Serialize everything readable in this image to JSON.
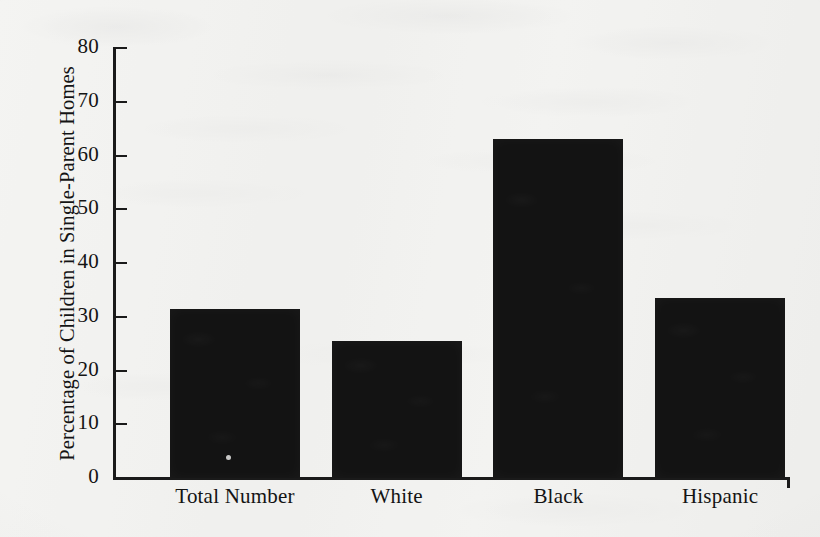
{
  "chart_data": {
    "type": "bar",
    "title": "",
    "subtitle": "",
    "xlabel": "",
    "ylabel": "Percentage of Children in Single-Parent Homes",
    "categories": [
      "Total Number",
      "White",
      "Black",
      "Hispanic"
    ],
    "values": [
      31.5,
      25.5,
      63,
      33.5
    ],
    "ylim": [
      0,
      80
    ],
    "ytick_labels": [
      "80",
      "70",
      "60",
      "50",
      "40",
      "30",
      "20",
      "10",
      "0"
    ],
    "ytick_values": [
      80,
      70,
      60,
      50,
      40,
      30,
      20,
      10,
      0
    ],
    "grid": false,
    "legend": null,
    "legend_position": "none",
    "bar_color": "#131313",
    "axis_color": "#1a1a1a",
    "background_color": "#f2f2f0"
  },
  "figure": {
    "media": "scanned-textbook-page",
    "paper_color": "#f2f2f0"
  }
}
